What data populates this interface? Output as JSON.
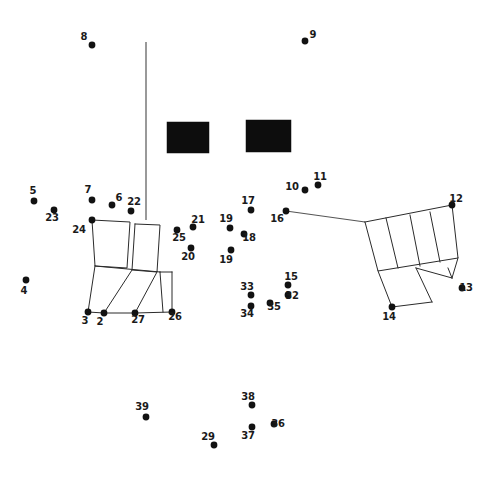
{
  "figure": {
    "width": 499,
    "height": 480,
    "background_color": "#ffffff",
    "ink_color": "#121212",
    "line_color": "#2b2b2b",
    "block_color": "#0d0d0d"
  },
  "chart_data": {
    "type": "scatter",
    "title": "",
    "xlabel": "",
    "ylabel": "",
    "xlim": [
      0,
      499
    ],
    "ylim": [
      480,
      0
    ],
    "grid": false,
    "legend": "none",
    "note": "Numbered point plot over line-drawn rectangular structures; labels are point identifiers, not values.",
    "point_labels": [
      "8",
      "9",
      "5",
      "7",
      "6",
      "22",
      "23",
      "24",
      "17",
      "10",
      "11",
      "16",
      "12",
      "25",
      "21",
      "19",
      "18",
      "20",
      "19",
      "4",
      "15",
      "32",
      "33",
      "34",
      "35",
      "13",
      "14",
      "3",
      "2",
      "27",
      "26",
      "39",
      "38",
      "37",
      "36",
      "29"
    ],
    "points": [
      {
        "label": "8",
        "x": 92,
        "y": 45,
        "label_x": 84,
        "label_y": 40
      },
      {
        "label": "9",
        "x": 305,
        "y": 41,
        "label_x": 313,
        "label_y": 38
      },
      {
        "label": "5",
        "x": 34,
        "y": 201,
        "label_x": 33,
        "label_y": 194
      },
      {
        "label": "23",
        "x": 54,
        "y": 210,
        "label_x": 52,
        "label_y": 221
      },
      {
        "label": "7",
        "x": 92,
        "y": 200,
        "label_x": 88,
        "label_y": 193
      },
      {
        "label": "6",
        "x": 112,
        "y": 205,
        "label_x": 119,
        "label_y": 201
      },
      {
        "label": "22",
        "x": 131,
        "y": 211,
        "label_x": 134,
        "label_y": 205
      },
      {
        "label": "4",
        "x": 26,
        "y": 280,
        "label_x": 24,
        "label_y": 294
      },
      {
        "label": "24",
        "x": 92,
        "y": 220,
        "label_x": 79,
        "label_y": 233
      },
      {
        "label": "25",
        "x": 177,
        "y": 230,
        "label_x": 179,
        "label_y": 241
      },
      {
        "label": "21",
        "x": 193,
        "y": 227,
        "label_x": 198,
        "label_y": 223
      },
      {
        "label": "20",
        "x": 191,
        "y": 248,
        "label_x": 188,
        "label_y": 260
      },
      {
        "label": "17",
        "x": 251,
        "y": 210,
        "label_x": 248,
        "label_y": 204
      },
      {
        "label": "19",
        "x": 230,
        "y": 228,
        "label_x": 226,
        "label_y": 222
      },
      {
        "label": "18",
        "x": 244,
        "y": 234,
        "label_x": 249,
        "label_y": 241
      },
      {
        "label": "19",
        "x": 231,
        "y": 250,
        "label_x": 226,
        "label_y": 263
      },
      {
        "label": "10",
        "x": 305,
        "y": 190,
        "label_x": 292,
        "label_y": 190
      },
      {
        "label": "11",
        "x": 318,
        "y": 185,
        "label_x": 320,
        "label_y": 180
      },
      {
        "label": "16",
        "x": 286,
        "y": 211,
        "label_x": 277,
        "label_y": 222
      },
      {
        "label": "12",
        "x": 452,
        "y": 205,
        "label_x": 456,
        "label_y": 202
      },
      {
        "label": "13",
        "x": 462,
        "y": 288,
        "label_x": 466,
        "label_y": 291
      },
      {
        "label": "14",
        "x": 392,
        "y": 307,
        "label_x": 389,
        "label_y": 320
      },
      {
        "label": "15",
        "x": 288,
        "y": 285,
        "label_x": 291,
        "label_y": 280
      },
      {
        "label": "32",
        "x": 288,
        "y": 295,
        "label_x": 292,
        "label_y": 299
      },
      {
        "label": "33",
        "x": 251,
        "y": 295,
        "label_x": 247,
        "label_y": 290
      },
      {
        "label": "34",
        "x": 251,
        "y": 306,
        "label_x": 247,
        "label_y": 317
      },
      {
        "label": "35",
        "x": 270,
        "y": 303,
        "label_x": 274,
        "label_y": 310
      },
      {
        "label": "3",
        "x": 88,
        "y": 312,
        "label_x": 85,
        "label_y": 324
      },
      {
        "label": "2",
        "x": 104,
        "y": 313,
        "label_x": 100,
        "label_y": 325
      },
      {
        "label": "27",
        "x": 135,
        "y": 313,
        "label_x": 138,
        "label_y": 323
      },
      {
        "label": "26",
        "x": 172,
        "y": 312,
        "label_x": 175,
        "label_y": 320
      },
      {
        "label": "39",
        "x": 146,
        "y": 417,
        "label_x": 142,
        "label_y": 410
      },
      {
        "label": "38",
        "x": 252,
        "y": 405,
        "label_x": 248,
        "label_y": 400
      },
      {
        "label": "37",
        "x": 252,
        "y": 427,
        "label_x": 248,
        "label_y": 439
      },
      {
        "label": "36",
        "x": 274,
        "y": 424,
        "label_x": 278,
        "label_y": 427
      },
      {
        "label": "29",
        "x": 214,
        "y": 445,
        "label_x": 208,
        "label_y": 440
      }
    ],
    "solid_blocks": [
      {
        "name": "block-left",
        "x": 167,
        "y": 122,
        "width": 42,
        "height": 31
      },
      {
        "name": "block-right",
        "x": 246,
        "y": 120,
        "width": 45,
        "height": 32
      }
    ],
    "wall_segments": [
      {
        "name": "vertical-wall",
        "points": "146,42 146,220"
      },
      {
        "name": "north-baulk",
        "points": "286,211 365,222"
      }
    ],
    "structures": [
      {
        "name": "left-structure",
        "polylines": [
          "92,220 130,222 127,268 95,266 92,220",
          "135,224 160,225 157,272 132,270 135,224",
          "95,266 160,272",
          "160,272 172,272",
          "95,266 88,312",
          "132,270 104,313",
          "157,272 135,313",
          "88,312 104,313 135,313 172,312",
          "160,272 163,312",
          "172,272 172,312"
        ]
      },
      {
        "name": "right-structure",
        "polylines": [
          "365,222 452,205 458,258 378,271 365,222",
          "386,218 398,268",
          "410,215 420,266",
          "430,212 440,262",
          "378,271 392,307",
          "416,268 432,302",
          "392,307 432,302",
          "452,278 458,258",
          "448,268 452,278",
          "416,268 452,278"
        ]
      }
    ]
  }
}
